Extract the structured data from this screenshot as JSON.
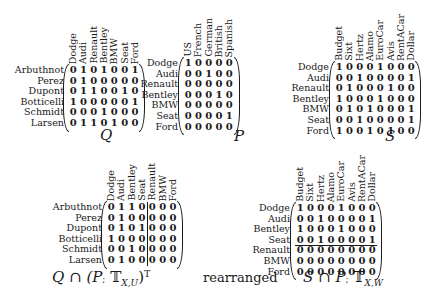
{
  "matrices": {
    "Q": {
      "caption": "Q",
      "rows": [
        "Arbuthnot",
        "Perez",
        "Dupont",
        "Botticelli",
        "Schmidt",
        "Larsen"
      ],
      "cols": [
        "Dodge",
        "Audi",
        "Renault",
        "Bentley",
        "BMW",
        "Seat",
        "Ford"
      ],
      "values": [
        [
          0,
          1,
          0,
          1,
          0,
          0,
          1
        ],
        [
          0,
          1,
          0,
          0,
          0,
          0,
          0
        ],
        [
          0,
          1,
          1,
          0,
          0,
          1,
          0
        ],
        [
          1,
          0,
          0,
          0,
          0,
          0,
          1
        ],
        [
          0,
          0,
          0,
          1,
          0,
          0,
          0
        ],
        [
          0,
          1,
          1,
          0,
          1,
          0,
          0
        ]
      ]
    },
    "P": {
      "caption": "P",
      "rows": [
        "Dodge",
        "Audi",
        "Renault",
        "Bentley",
        "BMW",
        "Seat",
        "Ford"
      ],
      "cols": [
        "US",
        "French",
        "German",
        "British",
        "Spanish"
      ],
      "values": [
        [
          1,
          0,
          0,
          0,
          0
        ],
        [
          0,
          0,
          1,
          0,
          0
        ],
        [
          0,
          0,
          0,
          0,
          0
        ],
        [
          0,
          0,
          0,
          1,
          0
        ],
        [
          0,
          0,
          0,
          0,
          0
        ],
        [
          0,
          0,
          0,
          0,
          1
        ],
        [
          0,
          0,
          0,
          0,
          0
        ]
      ]
    },
    "S": {
      "caption": "S",
      "rows": [
        "Dodge",
        "Audi",
        "Renault",
        "Bentley",
        "BMW",
        "Seat",
        "Ford"
      ],
      "cols": [
        "Budget",
        "Sixt",
        "Hertz",
        "Alamo",
        "EuroCar",
        "Avis",
        "RentACar",
        "Dollar"
      ],
      "values": [
        [
          1,
          0,
          0,
          0,
          1,
          0,
          0,
          0
        ],
        [
          0,
          0,
          1,
          0,
          0,
          0,
          0,
          1
        ],
        [
          0,
          1,
          0,
          0,
          0,
          1,
          0,
          0
        ],
        [
          1,
          0,
          0,
          0,
          1,
          0,
          0,
          0
        ],
        [
          0,
          1,
          0,
          1,
          0,
          0,
          0,
          1
        ],
        [
          0,
          0,
          1,
          0,
          0,
          0,
          0,
          1
        ],
        [
          1,
          0,
          0,
          1,
          0,
          1,
          0,
          0
        ]
      ]
    },
    "QP": {
      "caption": "Q ∩ (P; 𝕋X,U)ᵀ",
      "caption_main": "Q ∩ (P",
      "caption_semi": ";",
      "caption_T": " 𝕋",
      "caption_sub": "X,U",
      "caption_tail": ")ᵀ",
      "rows": [
        "Arbuthnot",
        "Perez",
        "Dupont",
        "Botticelli",
        "Schmidt",
        "Larsen"
      ],
      "cols": [
        "Dodge",
        "Audi",
        "Bentley",
        "Seat",
        "Renault",
        "BMW",
        "Ford"
      ],
      "divider_after_col": 4,
      "values": [
        [
          0,
          1,
          1,
          0,
          0,
          0,
          0
        ],
        [
          0,
          1,
          0,
          0,
          0,
          0,
          0
        ],
        [
          0,
          1,
          0,
          1,
          0,
          0,
          0
        ],
        [
          1,
          0,
          0,
          0,
          0,
          0,
          0
        ],
        [
          0,
          0,
          1,
          0,
          0,
          0,
          0
        ],
        [
          0,
          1,
          0,
          0,
          0,
          0,
          0
        ]
      ]
    },
    "SP": {
      "caption": "S ∩ P; 𝕋X,W",
      "caption_main": "S ∩ P",
      "caption_semi": ";",
      "caption_T": " 𝕋",
      "caption_sub": "X,W",
      "rows": [
        "Dodge",
        "Audi",
        "Bentley",
        "Seat",
        "Renault",
        "BMW",
        "Ford"
      ],
      "cols": [
        "Budget",
        "Sixt",
        "Hertz",
        "Alamo",
        "EuroCar",
        "Avis",
        "RentACar",
        "Dollar"
      ],
      "divider_after_row": 4,
      "values": [
        [
          1,
          0,
          0,
          0,
          1,
          0,
          0,
          0
        ],
        [
          0,
          0,
          1,
          0,
          0,
          0,
          0,
          1
        ],
        [
          1,
          0,
          0,
          0,
          1,
          0,
          0,
          0
        ],
        [
          0,
          0,
          1,
          0,
          0,
          0,
          0,
          1
        ],
        [
          0,
          0,
          0,
          0,
          0,
          0,
          0,
          0
        ],
        [
          0,
          0,
          0,
          0,
          0,
          0,
          0,
          0
        ],
        [
          0,
          0,
          0,
          0,
          0,
          0,
          0,
          0
        ]
      ]
    }
  },
  "middle_label": "rearranged"
}
